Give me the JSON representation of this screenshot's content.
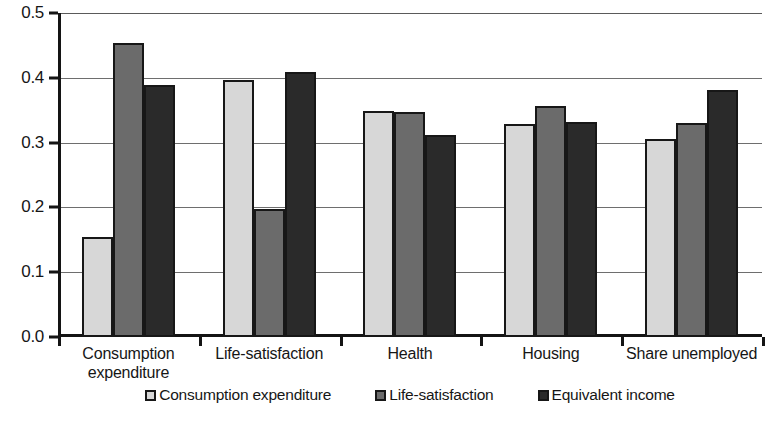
{
  "chart_data": {
    "type": "bar",
    "title": "",
    "xlabel": "",
    "ylabel": "",
    "ylim": [
      0.0,
      0.5
    ],
    "grid": true,
    "legend_position": "bottom",
    "categories": [
      "Consumption\nexpenditure",
      "Life-satisfaction",
      "Health",
      "Housing",
      "Share unemployed"
    ],
    "ytick_labels": [
      "0.0",
      "0.1",
      "0.2",
      "0.3",
      "0.4",
      "0.5"
    ],
    "ytick_values": [
      0.0,
      0.1,
      0.2,
      0.3,
      0.4,
      0.5
    ],
    "series": [
      {
        "name": "Consumption expenditure",
        "color": "#d7d7d7",
        "values": [
          0.155,
          0.396,
          0.349,
          0.328,
          0.306
        ]
      },
      {
        "name": "Life-satisfaction",
        "color": "#6b6b6b",
        "values": [
          0.454,
          0.198,
          0.348,
          0.356,
          0.33
        ]
      },
      {
        "name": "Equivalent income",
        "color": "#2a2a2a",
        "values": [
          0.389,
          0.409,
          0.312,
          0.332,
          0.381
        ]
      }
    ]
  },
  "legend": {
    "items": [
      {
        "label": "Consumption expenditure",
        "swatch": "s0"
      },
      {
        "label": "Life-satisfaction",
        "swatch": "s1"
      },
      {
        "label": "Equivalent income",
        "swatch": "s2"
      }
    ]
  },
  "bleed": {
    "text": ""
  }
}
